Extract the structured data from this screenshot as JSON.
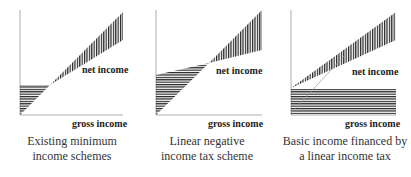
{
  "panels": [
    {
      "net_label": "net income",
      "gross_label": "gross income",
      "caption_line1": "Existing minimum",
      "caption_line2": "income schemes"
    },
    {
      "net_label": "net income",
      "gross_label": "gross income",
      "caption_line1": "Linear negative",
      "caption_line2": "income tax scheme"
    },
    {
      "net_label": "net income",
      "gross_label": "gross income",
      "caption_line1": "Basic income financed by",
      "caption_line2": "a linear income tax"
    }
  ],
  "colors": {
    "ink": "#222222",
    "axis": "#888888"
  }
}
